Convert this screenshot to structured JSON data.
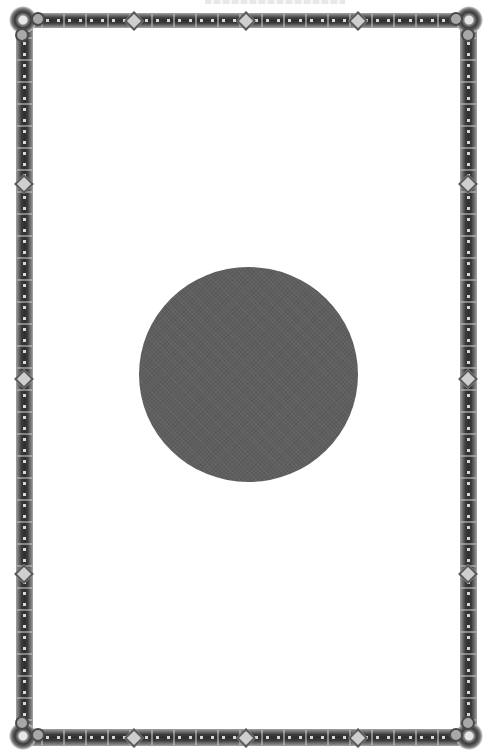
{
  "page": {
    "background_color": "#ffffff",
    "top_bleed_text": ""
  },
  "border": {
    "style": "ornamental interlaced frame",
    "color": "#4a4a4a",
    "highlight_color": "#d8d8d8",
    "corners": [
      "top-left-rosette",
      "top-right-rosette",
      "bottom-left-rosette",
      "bottom-right-rosette"
    ]
  },
  "center_disc": {
    "shape": "circle",
    "color": "#5e5e5e"
  }
}
